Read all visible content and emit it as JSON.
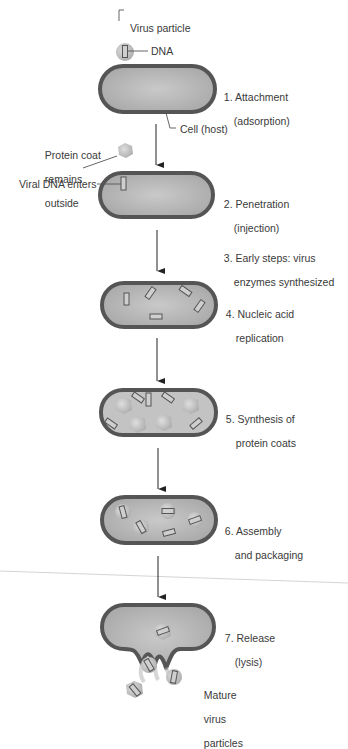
{
  "diagram": {
    "type": "virus-replication-cycle",
    "colors": {
      "cell_wall": "#555555",
      "cell_fill": "#bdbdbd",
      "dna_box": "#6a6a6a",
      "capsid": "#c8c8c8",
      "arrow": "#222222",
      "text": "#3a3a3a"
    },
    "labels": {
      "virus_particle": "Virus particle",
      "dna": "DNA",
      "cell_host": "Cell (host)",
      "protein_coat_1": "Protein coat",
      "protein_coat_2": "remains",
      "protein_coat_3": "outside",
      "viral_dna_enters": "Viral DNA enters",
      "mature_1": "Mature",
      "mature_2": "virus",
      "mature_3": "particles"
    },
    "steps": [
      {
        "number": "1.",
        "line1": "Attachment",
        "line2": "(adsorption)"
      },
      {
        "number": "2.",
        "line1": "Penetration",
        "line2": "(injection)"
      },
      {
        "number": "3.",
        "line1": "Early steps: virus",
        "line2": "enzymes synthesized"
      },
      {
        "number": "4.",
        "line1": "Nucleic acid",
        "line2": "replication"
      },
      {
        "number": "5.",
        "line1": "Synthesis of",
        "line2": "protein coats"
      },
      {
        "number": "6.",
        "line1": "Assembly",
        "line2": "and packaging"
      },
      {
        "number": "7.",
        "line1": "Release",
        "line2": "(lysis)"
      }
    ]
  }
}
